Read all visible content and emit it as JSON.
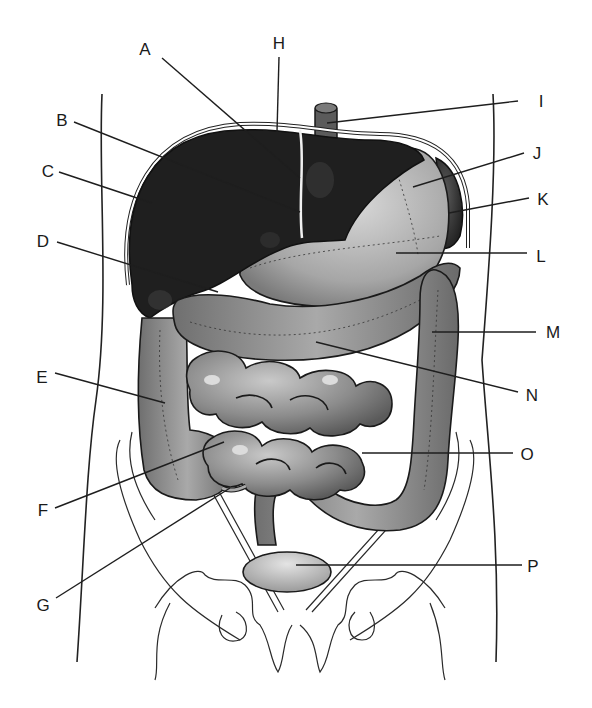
{
  "diagram": {
    "labels": [
      {
        "id": "A",
        "x": 145,
        "y": 55,
        "anchor": "middle",
        "line": [
          162,
          58,
          300,
          178
        ]
      },
      {
        "id": "H",
        "x": 279,
        "y": 49,
        "anchor": "middle",
        "line": [
          279,
          57,
          277,
          132
        ]
      },
      {
        "id": "I",
        "x": 541,
        "y": 107,
        "anchor": "middle",
        "line": [
          518,
          101,
          327,
          123
        ]
      },
      {
        "id": "B",
        "x": 62,
        "y": 126,
        "anchor": "middle",
        "line": [
          74,
          122,
          300,
          212
        ]
      },
      {
        "id": "J",
        "x": 537,
        "y": 159,
        "anchor": "middle",
        "line": [
          524,
          153,
          413,
          187
        ]
      },
      {
        "id": "C",
        "x": 48,
        "y": 177,
        "anchor": "middle",
        "line": [
          59,
          172,
          152,
          203
        ]
      },
      {
        "id": "K",
        "x": 543,
        "y": 205,
        "anchor": "middle",
        "line": [
          529,
          198,
          449,
          213
        ]
      },
      {
        "id": "D",
        "x": 43,
        "y": 247,
        "anchor": "middle",
        "line": [
          57,
          242,
          218,
          292
        ]
      },
      {
        "id": "L",
        "x": 541,
        "y": 262,
        "anchor": "middle",
        "line": [
          527,
          253,
          396,
          253
        ]
      },
      {
        "id": "M",
        "x": 553,
        "y": 338,
        "anchor": "middle",
        "line": [
          536,
          332,
          432,
          332
        ]
      },
      {
        "id": "E",
        "x": 42,
        "y": 383,
        "anchor": "middle",
        "line": [
          55,
          373,
          165,
          403
        ]
      },
      {
        "id": "N",
        "x": 532,
        "y": 401,
        "anchor": "middle",
        "line": [
          518,
          392,
          316,
          342
        ]
      },
      {
        "id": "O",
        "x": 527,
        "y": 460,
        "anchor": "middle",
        "line": [
          513,
          453,
          362,
          453
        ]
      },
      {
        "id": "F",
        "x": 43,
        "y": 516,
        "anchor": "middle",
        "line": [
          55,
          508,
          224,
          442
        ]
      },
      {
        "id": "G",
        "x": 43,
        "y": 611,
        "anchor": "middle",
        "line": [
          56,
          598,
          230,
          488
        ]
      },
      {
        "id": "P",
        "x": 533,
        "y": 572,
        "anchor": "middle",
        "line": [
          522,
          565,
          296,
          565
        ]
      }
    ],
    "colors": {
      "liver": "#1f1f1f",
      "stomach": "#b4b4b4",
      "intestine": "#8a8a8a",
      "bladder": "#c8c8c8",
      "line": "#1e1e1e",
      "background": "#ffffff"
    }
  }
}
